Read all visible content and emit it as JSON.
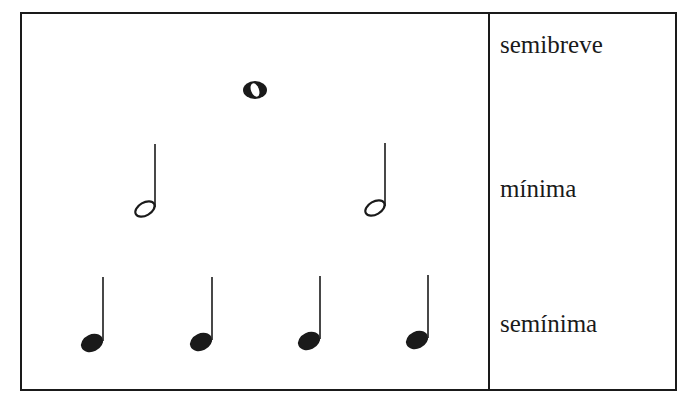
{
  "table": {
    "rows": [
      {
        "label": "semibreve",
        "note_type": "whole-note",
        "count": 1
      },
      {
        "label": "mínima",
        "note_type": "half-note",
        "count": 2
      },
      {
        "label": "semínima",
        "note_type": "quarter-note",
        "count": 4
      }
    ]
  },
  "colors": {
    "ink": "#1a1a1a",
    "background": "#ffffff"
  }
}
